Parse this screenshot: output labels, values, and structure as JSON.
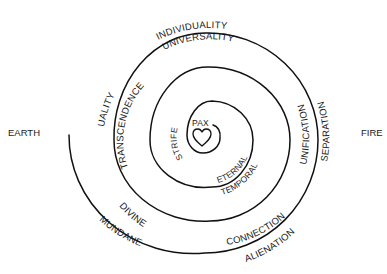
{
  "diagram": {
    "type": "spiral",
    "side_labels": {
      "left": "EARTH",
      "right": "FIRE"
    },
    "center": {
      "label": "PAX",
      "icon": "heart-icon"
    },
    "arc_labels": {
      "individuality": "INDIVIDUALITY",
      "universality": "UNIVERSALITY",
      "duality": "DUALITY",
      "transcendence": "TRANSCENDENCE",
      "unification": "UNIFICATION",
      "separation": "SEPARATION",
      "divine": "DIVINE",
      "mundane": "MUNDANE",
      "connection": "CONNECTION",
      "alienation": "ALIENATION",
      "strife": "STRIFE",
      "eternal": "ETERNAL",
      "temporal": "TEMPORAL"
    },
    "colors": {
      "stroke": "#111111",
      "text": "#1a1a1a",
      "background": "#ffffff"
    }
  }
}
